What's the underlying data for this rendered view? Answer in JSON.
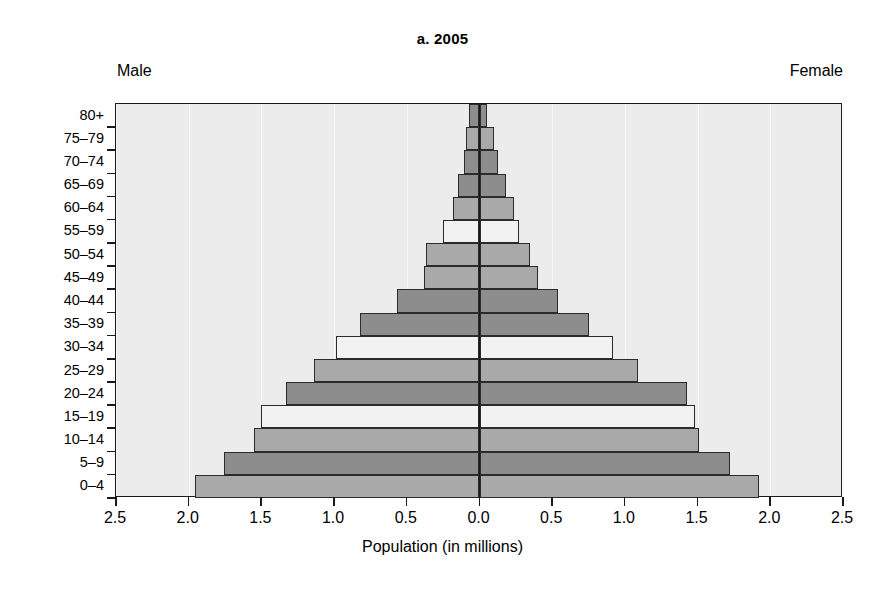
{
  "figure": {
    "title": "a. 2005",
    "male_label": "Male",
    "female_label": "Female",
    "xaxis_title": "Population (in millions)"
  },
  "colors": {
    "plot_background": "#ececec",
    "axis": "#1a1a1a",
    "bar_dark": "#8d8d8d",
    "bar_medium": "#a9a9a9",
    "bar_light": "#f2f2f2",
    "bar_outline": "#2b2b2b"
  },
  "chart_data": {
    "type": "bar",
    "subtype": "population-pyramid",
    "title": "a. 2005",
    "xlabel": "Population (in millions)",
    "ylabel": "",
    "xlim": [
      -2.5,
      2.5
    ],
    "xticks": [
      -2.5,
      -2.0,
      -1.5,
      -1.0,
      -0.5,
      0.0,
      0.5,
      1.0,
      1.5,
      2.0,
      2.5
    ],
    "xticklabels": [
      "2.5",
      "2.0",
      "1.5",
      "1.0",
      "0.5",
      "0.0",
      "0.5",
      "1.0",
      "1.5",
      "2.0",
      "2.5"
    ],
    "grid": true,
    "legend": [
      "Male",
      "Female"
    ],
    "legend_position": "top-corners",
    "categories": [
      "0–4",
      "5–9",
      "10–14",
      "15–19",
      "20–24",
      "25–29",
      "30–34",
      "35–39",
      "40–44",
      "45–49",
      "50–54",
      "55–59",
      "60–64",
      "65–69",
      "70–74",
      "75–79",
      "80+"
    ],
    "series": [
      {
        "name": "Male",
        "side": "left",
        "values": [
          1.96,
          1.76,
          1.55,
          1.5,
          1.33,
          1.14,
          0.99,
          0.82,
          0.57,
          0.38,
          0.37,
          0.25,
          0.18,
          0.15,
          0.11,
          0.09,
          0.07
        ]
      },
      {
        "name": "Female",
        "side": "right",
        "values": [
          1.92,
          1.72,
          1.51,
          1.48,
          1.43,
          1.09,
          0.92,
          0.75,
          0.54,
          0.4,
          0.35,
          0.27,
          0.24,
          0.18,
          0.13,
          0.1,
          0.05
        ]
      }
    ],
    "bar_shades": [
      "medium",
      "dark",
      "medium",
      "light",
      "dark",
      "medium",
      "light",
      "dark",
      "dark",
      "medium",
      "medium",
      "light",
      "medium",
      "dark",
      "dark",
      "medium",
      "dark"
    ]
  },
  "ylabels": [
    "80+",
    "75–79",
    "70–74",
    "65–69",
    "60–64",
    "55–59",
    "50–54",
    "45–49",
    "40–44",
    "35–39",
    "30–34",
    "25–29",
    "20–24",
    "15–19",
    "10–14",
    "5–9",
    "0–4"
  ]
}
